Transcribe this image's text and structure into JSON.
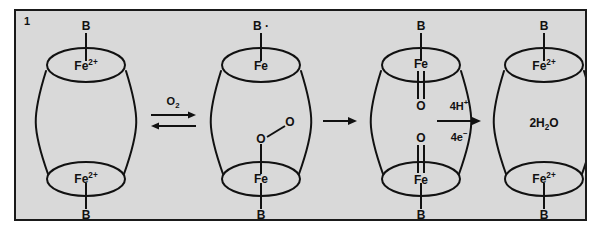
{
  "figure": {
    "panel_number": "1",
    "background_color": "#d9d9d9",
    "border_color": "#1a1a1a",
    "stroke_color": "#111111"
  },
  "structures": [
    {
      "id": "state-1",
      "name": "diferrous-resting-state",
      "top_ligand": "B",
      "top_metal": "Fe",
      "top_metal_charge": "2+",
      "bottom_metal": "Fe",
      "bottom_metal_charge": "2+",
      "bottom_ligand": "B",
      "center_label": ""
    },
    {
      "id": "state-2",
      "name": "peroxo-intermediate",
      "top_ligand": "B",
      "top_ligand_radical": "·",
      "top_metal": "Fe",
      "top_metal_charge": "",
      "bottom_metal": "Fe",
      "bottom_metal_charge": "",
      "bottom_ligand": "B",
      "bridge_o1": "O",
      "bridge_o2": "O",
      "center_label": ""
    },
    {
      "id": "state-3",
      "name": "diferryl-oxo-intermediate",
      "top_ligand": "B",
      "top_metal": "Fe",
      "top_metal_charge": "",
      "top_oxo": "O",
      "bottom_oxo": "O",
      "bottom_metal": "Fe",
      "bottom_metal_charge": "",
      "bottom_ligand": "B",
      "center_label": ""
    },
    {
      "id": "state-4",
      "name": "reduced-water-released-state",
      "top_ligand": "B",
      "top_metal": "Fe",
      "top_metal_charge": "2+",
      "bottom_metal": "Fe",
      "bottom_metal_charge": "2+",
      "bottom_ligand": "B",
      "center_label_prefix": "2H",
      "center_label_sub": "2",
      "center_label_suffix": "O"
    }
  ],
  "arrows": [
    {
      "id": "arrow-1",
      "name": "reversible-oxygen-binding-arrow",
      "type": "reversible",
      "label_above_prefix": "O",
      "label_above_sub": "2",
      "label_below": ""
    },
    {
      "id": "arrow-2",
      "name": "oxygen-oxygen-bond-cleavage-arrow",
      "type": "single",
      "label_above": "",
      "label_below": ""
    },
    {
      "id": "arrow-3",
      "name": "proton-electron-reduction-arrow",
      "type": "single",
      "label_above_prefix": "4H",
      "label_above_sup": "+",
      "label_below_prefix": "4e",
      "label_below_sup": "−"
    }
  ]
}
